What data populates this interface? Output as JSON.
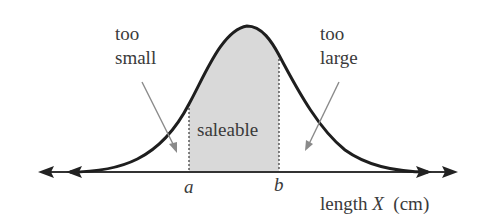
{
  "diagram": {
    "type": "normal-distribution-curve",
    "labels": {
      "too_small_line1": "too",
      "too_small_line2": "small",
      "too_large_line1": "too",
      "too_large_line2": "large",
      "saleable": "saleable",
      "a": "a",
      "b": "b",
      "axis_prefix": "length",
      "axis_var": "X",
      "axis_unit": "(cm)"
    },
    "colors": {
      "curve": "#1e1e1e",
      "axis": "#333333",
      "shade": "#d9d9d9",
      "pointer": "#8a8a8a",
      "text": "#3a3a3a"
    }
  }
}
